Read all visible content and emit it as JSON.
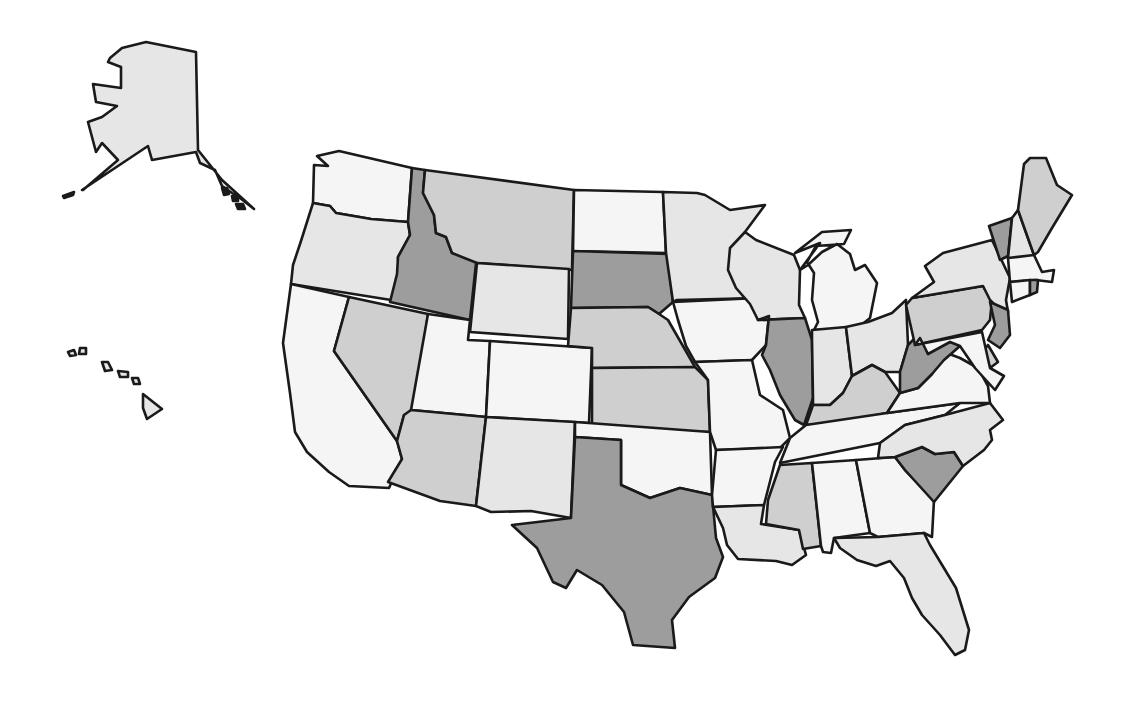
{
  "map": {
    "type": "choropleth",
    "region": "United States",
    "legend_visible": false,
    "shade_colors": {
      "white": "#f5f5f5",
      "light": "#e6e6e6",
      "medium": "#cfcfcf",
      "dark": "#9d9d9d"
    },
    "outline_color": "#1a1a1a",
    "states": [
      {
        "abbr": "AK",
        "name": "Alaska",
        "shade": "light",
        "points": "82,190 148,146 152,160 196,152 200,163 215,170 222,186 232,193 240,198 254,209 222,180 198,150 196,52 146,42 122,48 110,58 108,62 121,67 121,88 93,84 96,102 117,106 102,117 88,122 96,152 102,143 118,160 83,190"
      },
      {
        "abbr": "HI",
        "name": "Hawaii",
        "shade": "light",
        "points": "143,394 162,409 147,419 143,408"
      },
      {
        "abbr": "WA",
        "name": "Washington",
        "shade": "white",
        "points": "317,156 339,151 412,168 408,222 371,219 336,213 330,206 313,203 314,165 328,166"
      },
      {
        "abbr": "OR",
        "name": "Oregon",
        "shade": "light",
        "points": "313,203 330,206 336,213 371,219 408,222 410,235 398,257 399,275 391,300 291,284 293,265 301,241"
      },
      {
        "abbr": "CA",
        "name": "California",
        "shade": "white",
        "points": "291,284 349,297 334,351 397,441 402,459 389,488 349,486 329,472 307,452 295,432 290,393 283,343"
      },
      {
        "abbr": "ID",
        "name": "Idaho",
        "shade": "dark",
        "points": "412,168 425,170 423,193 434,215 436,233 446,237 452,253 477,254 470,320 390,302 397,274 398,257 410,235 408,222"
      },
      {
        "abbr": "NV",
        "name": "Nevada",
        "shade": "medium",
        "points": "349,297 428,314 414,415 404,415 397,441 334,351"
      },
      {
        "abbr": "MT",
        "name": "Montana",
        "shade": "medium",
        "points": "425,170 574,190 572,270 477,263 452,253 446,237 436,233 434,215 423,193"
      },
      {
        "abbr": "WY",
        "name": "Wyoming",
        "shade": "light",
        "points": "477,263 569,269 568,339 470,332"
      },
      {
        "abbr": "UT",
        "name": "Utah",
        "shade": "white",
        "points": "428,314 470,320 468,340 490,341 486,417 411,410"
      },
      {
        "abbr": "CO",
        "name": "Colorado",
        "shade": "white",
        "points": "490,341 592,348 589,423 486,417"
      },
      {
        "abbr": "AZ",
        "name": "Arizona",
        "shade": "medium",
        "points": "411,410 486,417 476,506 440,501 388,482 402,459 397,441 404,415"
      },
      {
        "abbr": "NM",
        "name": "New Mexico",
        "shade": "light",
        "points": "486,417 575,422 571,518 531,511 491,512 476,506"
      },
      {
        "abbr": "ND",
        "name": "North Dakota",
        "shade": "white",
        "points": "574,190 663,192 666,253 573,251"
      },
      {
        "abbr": "SD",
        "name": "South Dakota",
        "shade": "dark",
        "points": "573,251 668,254 673,302 659,314 648,307 571,308"
      },
      {
        "abbr": "NE",
        "name": "Nebraska",
        "shade": "medium",
        "points": "571,308 648,307 659,314 668,320 695,367 592,368 592,348 568,346"
      },
      {
        "abbr": "KS",
        "name": "Kansas",
        "shade": "medium",
        "points": "592,368 695,367 708,380 710,432 592,430"
      },
      {
        "abbr": "OK",
        "name": "Oklahoma",
        "shade": "white",
        "points": "575,422 710,432 712,495 680,488 650,498 621,485 621,440 575,437"
      },
      {
        "abbr": "TX",
        "name": "Texas",
        "shade": "dark",
        "points": "575,437 621,440 621,485 650,498 680,488 712,495 716,538 723,557 715,578 689,597 672,620 675,648 633,645 624,612 602,585 577,570 566,588 553,582 537,548 512,525 571,518"
      },
      {
        "abbr": "MN",
        "name": "Minnesota",
        "shade": "light",
        "points": "663,192 697,193 705,195 730,210 765,205 745,232 736,254 750,275 758,298 677,300 673,302 666,253"
      },
      {
        "abbr": "IA",
        "name": "Iowa",
        "shade": "white",
        "points": "673,302 758,298 769,316 766,345 752,360 695,362 686,346 678,320"
      },
      {
        "abbr": "MO",
        "name": "Missouri",
        "shade": "white",
        "points": "695,362 752,360 760,395 783,410 790,438 780,448 716,450 710,432 708,380"
      },
      {
        "abbr": "AR",
        "name": "Arkansas",
        "shade": "white",
        "points": "716,450 783,447 775,462 764,505 713,507 712,495"
      },
      {
        "abbr": "LA",
        "name": "Louisiana",
        "shade": "light",
        "points": "713,507 764,505 761,524 799,530 806,555 792,565 776,561 738,559 727,545 723,528"
      },
      {
        "abbr": "WI",
        "name": "Wisconsin",
        "shade": "light",
        "points": "745,232 756,240 794,255 800,270 799,305 805,318 758,320 750,304 736,288 728,270 730,248"
      },
      {
        "abbr": "IL",
        "name": "Illinois",
        "shade": "dark",
        "points": "758,320 805,318 812,340 813,398 804,425 795,420 780,395 770,370 762,355 766,345 769,316"
      },
      {
        "abbr": "MI",
        "name": "Michigan",
        "shade": "white",
        "points": "795,253 822,232 851,230 844,244 816,246 807,262 814,273 812,300 818,322 814,330 855,330 870,318 877,283 865,265 855,270 850,254 837,244 822,252 808,265 800,270 820,243"
      },
      {
        "abbr": "IN",
        "name": "Indiana",
        "shade": "light",
        "points": "812,330 846,327 852,376 843,393 830,405 813,405 813,398 812,340"
      },
      {
        "abbr": "OH",
        "name": "Ohio",
        "shade": "light",
        "points": "846,327 868,322 892,313 906,300 908,345 900,372 885,372 872,365 852,376"
      },
      {
        "abbr": "KY",
        "name": "Kentucky",
        "shade": "medium",
        "points": "813,405 830,405 843,393 852,376 872,365 885,372 900,393 887,413 836,423 806,425"
      },
      {
        "abbr": "TN",
        "name": "Tennessee",
        "shade": "white",
        "points": "806,425 887,413 960,403 945,415 905,425 890,436 880,443 780,463 790,438"
      },
      {
        "abbr": "MS",
        "name": "Mississippi",
        "shade": "medium",
        "points": "780,465 812,463 821,546 803,549 799,530 766,524 768,500"
      },
      {
        "abbr": "AL",
        "name": "Alabama",
        "shade": "white",
        "points": "812,463 856,460 870,533 834,538 831,553 823,552 821,546"
      },
      {
        "abbr": "GA",
        "name": "Georgia",
        "shade": "white",
        "points": "856,460 895,457 905,470 934,500 932,537 924,533 878,537 870,533"
      },
      {
        "abbr": "FL",
        "name": "Florida",
        "shade": "light",
        "points": "834,538 878,537 924,533 930,545 956,588 969,630 965,650 955,655 940,635 922,615 912,598 904,578 890,561 876,566 857,560 840,548"
      },
      {
        "abbr": "SC",
        "name": "South Carolina",
        "shade": "dark",
        "points": "895,457 922,447 935,454 954,452 963,466 934,502 905,470"
      },
      {
        "abbr": "NC",
        "name": "North Carolina",
        "shade": "light",
        "points": "880,443 905,425 945,415 990,403 1003,420 990,430 992,440 984,450 963,466 954,452 935,454 922,447 895,457 878,458"
      },
      {
        "abbr": "VA",
        "name": "Virginia",
        "shade": "white",
        "points": "887,413 900,393 918,388 932,374 944,352 960,358 978,368 988,386 990,403 960,403"
      },
      {
        "abbr": "WV",
        "name": "West Virginia",
        "shade": "dark",
        "points": "900,372 908,345 920,333 928,354 952,338 960,346 944,360 932,374 918,388 900,393"
      },
      {
        "abbr": "PA",
        "name": "Pennsylvania",
        "shade": "medium",
        "points": "906,305 912,298 983,286 992,300 990,320 982,330 915,345"
      },
      {
        "abbr": "NY",
        "name": "New York",
        "shade": "light",
        "points": "912,298 934,282 925,266 943,253 992,240 1010,278 1006,300 1008,312 996,306 990,300 983,286"
      },
      {
        "abbr": "NJ",
        "name": "New Jersey",
        "shade": "dark",
        "points": "990,302 1008,310 1010,335 1000,348 988,340 995,325"
      },
      {
        "abbr": "DE",
        "name": "Delaware",
        "shade": "medium",
        "points": "988,345 998,362 990,368 984,350"
      },
      {
        "abbr": "MD",
        "name": "Maryland",
        "shade": "white",
        "points": "915,345 982,332 990,368 1004,376 995,390 975,368 960,346 950,342 928,354 920,338"
      },
      {
        "abbr": "VT",
        "name": "Vermont",
        "shade": "dark",
        "points": "989,226 1012,218 1008,256 1000,260"
      },
      {
        "abbr": "NH",
        "name": "New Hampshire",
        "shade": "light",
        "points": "1012,218 1018,210 1034,255 1026,260 1008,258"
      },
      {
        "abbr": "ME",
        "name": "Maine",
        "shade": "medium",
        "points": "1018,210 1024,164 1030,158 1046,158 1057,185 1072,195 1052,228 1038,252 1034,255"
      },
      {
        "abbr": "MA",
        "name": "Massachusetts",
        "shade": "white",
        "points": "1008,258 1034,255 1042,272 1054,270 1052,282 1036,280 1010,282"
      },
      {
        "abbr": "CT",
        "name": "Connecticut",
        "shade": "white",
        "points": "1010,282 1030,280 1030,295 1012,302"
      },
      {
        "abbr": "RI",
        "name": "Rhode Island",
        "shade": "dark",
        "points": "1030,280 1038,280 1037,292 1030,295"
      }
    ],
    "hawaii_islands": [
      {
        "points": "68,352 74,350 76,355 70,356"
      },
      {
        "points": "80,348 86,348 86,354 79,354"
      },
      {
        "points": "102,362 108,362 112,370 105,371"
      },
      {
        "points": "118,371 128,372 128,377 120,377"
      },
      {
        "points": "132,378 138,378 140,384 134,384"
      }
    ],
    "alaska_islands": [
      {
        "points": "63,196 74,192 73,195 64,198"
      },
      {
        "points": "222,188 227,188 229,194 224,195"
      },
      {
        "points": "232,196 238,196 238,201 233,201"
      },
      {
        "points": "236,204 243,204 245,209 238,209"
      }
    ]
  }
}
